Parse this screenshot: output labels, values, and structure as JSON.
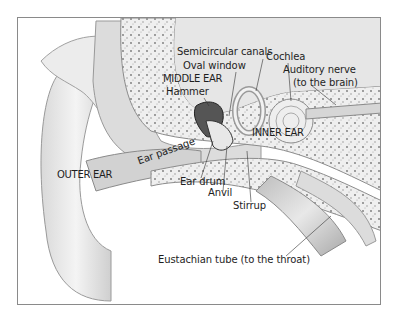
{
  "diagram": {
    "frame_color": "#8a8a8a",
    "labels": {
      "semicircular_canals": "Semicircular canals",
      "oval_window": "Oval window",
      "middle_ear": "MIDDLE EAR",
      "hammer": "Hammer",
      "cochlea": "Cochlea",
      "auditory_nerve": "Auditory nerve",
      "to_brain": "(to the brain)",
      "inner_ear": "INNER EAR",
      "ear_passage": "Ear passage",
      "outer_ear": "OUTER EAR",
      "ear_drum": "Ear drum",
      "anvil": "Anvil",
      "stirrup": "Stirrup",
      "eustachian_tube": "Eustachian tube (to the throat)"
    }
  }
}
